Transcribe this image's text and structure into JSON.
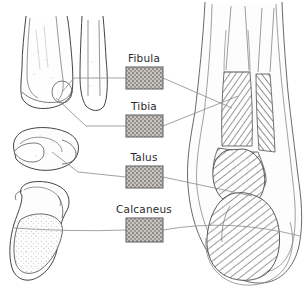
{
  "figure": {
    "background_color": "#ffffff",
    "line_color": "#4a4a4a",
    "leader_line_color": "#8a8a8a",
    "label_text_color": "#2b2b2b",
    "swatch_border_color": "#6b6b6b",
    "swatch_fill_color": "#b0aca8"
  },
  "labels": [
    {
      "id": "fibula",
      "text": "Fibula",
      "text_x": 144,
      "text_y": 62,
      "swatch": {
        "x": 126,
        "y": 67,
        "w": 37,
        "h": 22
      },
      "icon": "texture-swatch"
    },
    {
      "id": "tibia",
      "text": "Tibia",
      "text_x": 144,
      "text_y": 110,
      "swatch": {
        "x": 126,
        "y": 115,
        "w": 37,
        "h": 22
      },
      "icon": "texture-swatch"
    },
    {
      "id": "talus",
      "text": "Talus",
      "text_x": 144,
      "text_y": 161,
      "swatch": {
        "x": 126,
        "y": 166,
        "w": 37,
        "h": 22
      },
      "icon": "texture-swatch"
    },
    {
      "id": "calcaneus",
      "text": "Calcaneus",
      "text_x": 144,
      "text_y": 213,
      "swatch": {
        "x": 126,
        "y": 218,
        "w": 37,
        "h": 24
      },
      "icon": "texture-swatch"
    }
  ],
  "leader_lines": {
    "right": [
      {
        "id": "fibula-to-figure",
        "from": "fibula-swatch-right",
        "path": "M163,78 L232,108"
      },
      {
        "id": "tibia-to-figure",
        "from": "tibia-swatch-right",
        "path": "M163,126 L238,96"
      },
      {
        "id": "talus-to-figure",
        "from": "talus-swatch-right",
        "path": "M163,177 L252,196"
      },
      {
        "id": "calcaneus-to-figure",
        "from": "calcaneus-swatch-right",
        "path": "M163,230 Q230,218 300,236"
      }
    ],
    "left": [
      {
        "id": "fibula-to-inset",
        "from": "fibula-swatch-left",
        "path": "M126,78 L74,78 L62,92"
      },
      {
        "id": "tibia-to-inset",
        "from": "tibia-swatch-left",
        "path": "M126,126 L86,126 L56,98"
      },
      {
        "id": "talus-to-inset",
        "from": "talus-swatch-left",
        "path": "M126,177 L78,172 L52,152"
      },
      {
        "id": "calcaneus-to-inset",
        "from": "calcaneus-swatch-left",
        "path": "M126,230 Q72,232 14,228"
      }
    ]
  },
  "insets": [
    {
      "id": "distal-tibia-fibula-anterior",
      "name": "distal-leg-bone-pair-illustration",
      "x": 4,
      "y": 14,
      "w": 104,
      "h": 100
    },
    {
      "id": "talus-isolated",
      "name": "talus-bone-illustration",
      "x": 6,
      "y": 126,
      "w": 78,
      "h": 52
    },
    {
      "id": "calcaneus-isolated",
      "name": "calcaneus-bone-illustration",
      "x": 6,
      "y": 182,
      "w": 78,
      "h": 104
    }
  ],
  "main_illustration": {
    "id": "ankle-anterior-view",
    "name": "ankle-foot-anterior-illustration",
    "x": 186,
    "y": 2,
    "w": 118,
    "h": 286,
    "regions": [
      {
        "name": "tibia-shaft-hatched",
        "bone": "Tibia"
      },
      {
        "name": "fibula-shaft-hatched",
        "bone": "Fibula"
      },
      {
        "name": "talus-hatched",
        "bone": "Talus"
      },
      {
        "name": "calcaneus-hatched",
        "bone": "Calcaneus"
      }
    ]
  }
}
